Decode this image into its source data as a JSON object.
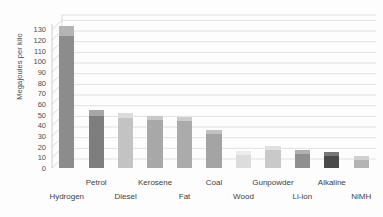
{
  "chart_data": {
    "type": "bar",
    "title": "",
    "subtitle": "",
    "xlabel": "",
    "ylabel": "Megajoules per kilo",
    "ylim": [
      0,
      135
    ],
    "yticks": [
      0,
      10,
      20,
      30,
      40,
      50,
      60,
      70,
      80,
      90,
      100,
      110,
      120,
      130
    ],
    "ytick_labels": [
      "0",
      "10",
      "20",
      "30",
      "40",
      "50",
      "60",
      "70",
      "80",
      "90",
      "100",
      "110",
      "120",
      "130"
    ],
    "grid": true,
    "legend": false,
    "legend_position": "none",
    "style": "3d-grayscale",
    "categories": [
      "Hydrogen",
      "Petrol",
      "Diesel",
      "Kerosene",
      "Fat",
      "Coal",
      "Wood",
      "Gunpowder",
      "Li-ion",
      "Alkaline",
      "NiMH"
    ],
    "values": [
      133,
      54,
      52,
      49,
      48,
      36,
      16,
      21,
      17,
      15,
      11
    ],
    "label_rows": [
      1,
      0,
      1,
      0,
      1,
      0,
      1,
      0,
      1,
      0,
      1
    ],
    "bar_colors": [
      "#8c8c8c",
      "#7e7e7e",
      "#c3c3c3",
      "#a8a8a8",
      "#ababab",
      "#a4a4a4",
      "#dcdcdc",
      "#c9c9c9",
      "#8f8f8f",
      "#4a4a4a",
      "#b4b4b4"
    ],
    "bar_cap_colors": [
      "#b4b4b4",
      "#a6a6a6",
      "#dcdcdc",
      "#c8c8c8",
      "#cccccc",
      "#c2c2c2",
      "#ececec",
      "#e0e0e0",
      "#b0b0b0",
      "#777777",
      "#d0d0d0"
    ]
  },
  "colors": {
    "background": "#fdfdfd",
    "gridline": "#d8d8d8",
    "axis": "#bdbdbd",
    "tick_text": "#4f4f4f",
    "label_text": "#3f3f3f"
  }
}
